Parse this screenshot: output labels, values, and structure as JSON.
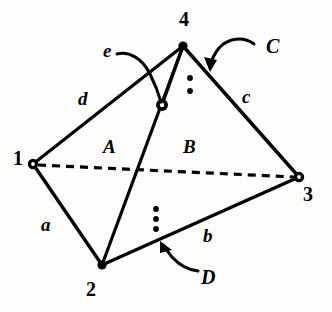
{
  "figure": {
    "type": "geometric-diagram",
    "background_color": "#fdfdfc",
    "stroke_color": "#000000"
  },
  "vertices": [
    {
      "id": "v1",
      "label": "1",
      "x": 33,
      "y": 164,
      "label_x": 13,
      "label_y": 148,
      "marker": "open-circle"
    },
    {
      "id": "v2",
      "label": "2",
      "x": 102,
      "y": 265,
      "label_x": 86,
      "label_y": 279,
      "marker": "dot"
    },
    {
      "id": "v3",
      "label": "3",
      "x": 299,
      "y": 177,
      "label_x": 303,
      "label_y": 184,
      "marker": "open-circle"
    },
    {
      "id": "v4",
      "label": "4",
      "x": 183,
      "y": 46,
      "label_x": 179,
      "label_y": 9,
      "marker": "dot"
    }
  ],
  "nodes": [
    {
      "id": "n-e",
      "x": 162,
      "y": 105,
      "marker": "open-circle"
    }
  ],
  "edges": [
    {
      "id": "edge-a",
      "label": "a",
      "from": "v1",
      "to": "v2",
      "style": "solid",
      "label_x": 41,
      "label_y": 215
    },
    {
      "id": "edge-b",
      "label": "b",
      "from": "v2",
      "to": "v3",
      "style": "solid",
      "label_x": 203,
      "label_y": 226
    },
    {
      "id": "edge-c",
      "label": "c",
      "from": "v4",
      "to": "v3",
      "style": "solid",
      "label_x": 242,
      "label_y": 87
    },
    {
      "id": "edge-d",
      "label": "d",
      "from": "v1",
      "to": "v4",
      "style": "solid",
      "label_x": 78,
      "label_y": 89
    },
    {
      "id": "edge-e",
      "label": "e",
      "from": "n-e",
      "to": "v4",
      "style": "solid",
      "label_x": 103,
      "label_y": 41
    },
    {
      "id": "edge-diagonal",
      "label": "",
      "from": "v1",
      "to": "v3",
      "style": "dashed",
      "label_x": 0,
      "label_y": 0
    },
    {
      "id": "edge-2-4",
      "label": "",
      "from": "v2",
      "to": "v4",
      "style": "solid",
      "label_x": 0,
      "label_y": 0
    }
  ],
  "faces": [
    {
      "id": "face-A",
      "label": "A",
      "x": 103,
      "y": 137
    },
    {
      "id": "face-B",
      "label": "B",
      "x": 183,
      "y": 137
    }
  ],
  "callouts": [
    {
      "id": "callout-C",
      "label": "C",
      "label_x": 266,
      "label_y": 36,
      "target_x": 211,
      "target_y": 70
    },
    {
      "id": "callout-D",
      "label": "D",
      "label_x": 201,
      "label_y": 267,
      "target_x": 161,
      "target_y": 243
    },
    {
      "id": "callout-e",
      "label": "e",
      "label_x": 103,
      "label_y": 41,
      "target_x": 161,
      "target_y": 101
    }
  ],
  "dot_groups": [
    {
      "id": "ellipsis-upper",
      "count": 2,
      "x": 190,
      "dots_y": [
        78,
        91
      ]
    },
    {
      "id": "ellipsis-lower",
      "count": 3,
      "x": 156,
      "dots_y": [
        209,
        219,
        229
      ]
    }
  ]
}
